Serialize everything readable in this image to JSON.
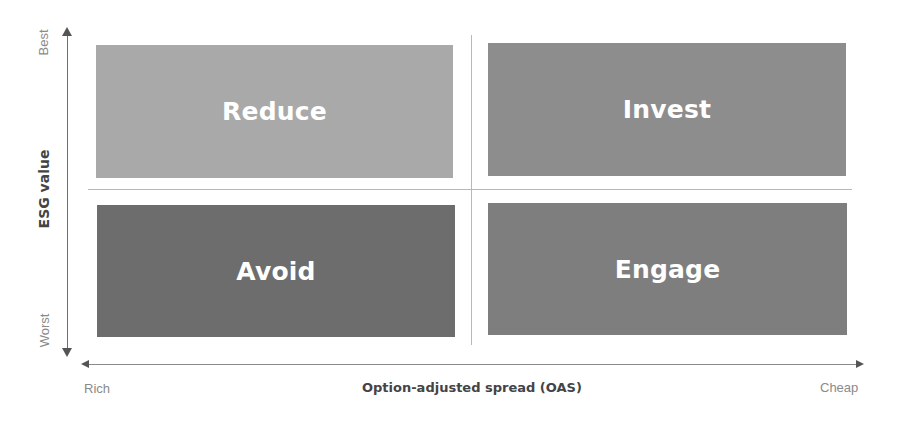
{
  "diagram": {
    "type": "2x2 matrix",
    "quadrants": [
      {
        "id": "top-left",
        "label": "Reduce",
        "color": "#a9a9a9"
      },
      {
        "id": "top-right",
        "label": "Invest",
        "color": "#8d8d8d"
      },
      {
        "id": "bottom-left",
        "label": "Avoid",
        "color": "#6d6d6d"
      },
      {
        "id": "bottom-right",
        "label": "Engage",
        "color": "#7e7e7e"
      }
    ],
    "y_axis": {
      "title": "ESG value",
      "top_label": "Best",
      "bottom_label": "Worst"
    },
    "x_axis": {
      "title": "Option-adjusted spread (OAS)",
      "left_label": "Rich",
      "right_label": "Cheap"
    }
  }
}
